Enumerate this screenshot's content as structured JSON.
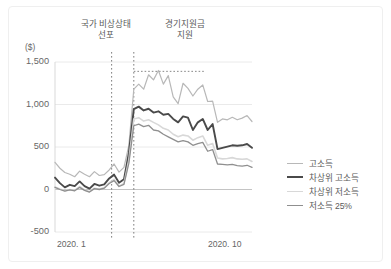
{
  "figure": {
    "unit_label": "($)",
    "annotations": [
      {
        "name": "national-emergency",
        "line1": "국가 비상상태",
        "line2": "선포"
      },
      {
        "name": "stimulus-payment",
        "line1": "경기지원금",
        "line2": "지원"
      }
    ]
  },
  "chart_data": {
    "type": "line",
    "title": "",
    "subtitle": "",
    "xlabel": "",
    "ylabel": "($)",
    "ylim": [
      -500,
      1500
    ],
    "yticks": [
      1500,
      1000,
      500,
      0,
      -500
    ],
    "ytick_labels": [
      "1,500",
      "1,000",
      "500",
      "0",
      "-500"
    ],
    "xticks": [
      0,
      40
    ],
    "xtick_labels": [
      "2020. 1",
      "2020. 10"
    ],
    "grid": true,
    "grid_axis": "y",
    "legend_position": "right",
    "annotations": [
      {
        "label": "국가 비상상태 선포",
        "x": 11.5,
        "type": "vline",
        "style": "dotted"
      },
      {
        "label": "경기지원금 지원",
        "x": 16.0,
        "type": "vline",
        "style": "dotted"
      },
      {
        "label": "지원금 기간",
        "x_start": 16.0,
        "x_end": 30.5,
        "y": 1390,
        "type": "hbracket",
        "style": "dotted"
      }
    ],
    "x": [
      0,
      1,
      2,
      3,
      4,
      5,
      6,
      7,
      8,
      9,
      10,
      11,
      12,
      13,
      14,
      15,
      16,
      17,
      18,
      19,
      20,
      21,
      22,
      23,
      24,
      25,
      26,
      27,
      28,
      29,
      30,
      31,
      32,
      33,
      34,
      35,
      36,
      37,
      38,
      39,
      40
    ],
    "series": [
      {
        "name": "고소득",
        "color": "#b8b8b8",
        "width": 1.2,
        "values": [
          320,
          250,
          200,
          180,
          150,
          215,
          180,
          150,
          210,
          165,
          175,
          230,
          300,
          205,
          260,
          520,
          1180,
          1240,
          1180,
          1350,
          1290,
          1400,
          1240,
          1340,
          1090,
          1010,
          1250,
          1190,
          1100,
          1180,
          1230,
          1035,
          1040,
          790,
          830,
          820,
          850,
          820,
          840,
          870,
          800
        ]
      },
      {
        "name": "차상위 고소득",
        "color": "#4a4a4a",
        "width": 1.9,
        "values": [
          140,
          75,
          25,
          55,
          40,
          95,
          40,
          10,
          65,
          45,
          60,
          130,
          175,
          80,
          120,
          430,
          945,
          975,
          930,
          950,
          905,
          920,
          880,
          890,
          830,
          790,
          860,
          845,
          700,
          790,
          830,
          700,
          770,
          475,
          490,
          505,
          520,
          515,
          520,
          535,
          490
        ]
      },
      {
        "name": "차상위 저소득",
        "color": "#d8d8d8",
        "width": 1.6,
        "values": [
          30,
          5,
          -15,
          0,
          -10,
          35,
          -5,
          -25,
          15,
          5,
          20,
          80,
          120,
          40,
          70,
          350,
          830,
          845,
          805,
          820,
          790,
          760,
          720,
          700,
          650,
          620,
          640,
          630,
          580,
          610,
          630,
          520,
          540,
          370,
          360,
          365,
          375,
          360,
          355,
          360,
          330
        ]
      },
      {
        "name": "저소득 25%",
        "color": "#8f8f8f",
        "width": 1.3,
        "values": [
          25,
          0,
          -20,
          -5,
          -15,
          25,
          -10,
          -30,
          10,
          0,
          15,
          70,
          105,
          35,
          60,
          310,
          750,
          770,
          740,
          755,
          700,
          690,
          650,
          620,
          590,
          560,
          575,
          560,
          520,
          540,
          555,
          450,
          470,
          300,
          295,
          290,
          295,
          280,
          275,
          285,
          260
        ]
      }
    ]
  },
  "legend": {
    "items": [
      {
        "label": "고소득",
        "color": "#b8b8b8",
        "width": 1.2
      },
      {
        "label": "차상위 고소득",
        "color": "#4a4a4a",
        "width": 2.4
      },
      {
        "label": "차상위 저소득",
        "color": "#d8d8d8",
        "width": 1.6
      },
      {
        "label": "저소득 25%",
        "color": "#8f8f8f",
        "width": 1.3
      }
    ]
  }
}
